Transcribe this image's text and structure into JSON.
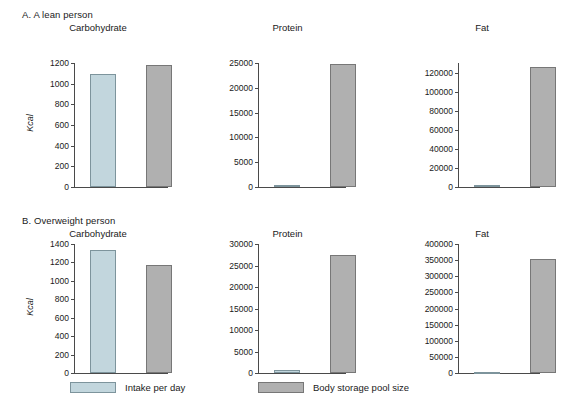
{
  "figure": {
    "panels": [
      {
        "id": "A",
        "label": "A. A lean person"
      },
      {
        "id": "B",
        "label": "B. Overweight person"
      }
    ],
    "axis_title": "Kcal",
    "legend": {
      "intake_label": "Intake per day",
      "storage_label": "Body storage pool size",
      "intake_color": "#c2d6dd",
      "storage_color": "#b0b0b0"
    }
  },
  "chart_data": [
    {
      "type": "bar",
      "panel": "A",
      "panel_label": "A. A lean person",
      "title": "Carbohydrate",
      "categories": [
        "Intake per day",
        "Body storage pool size"
      ],
      "values": [
        1090,
        1180
      ],
      "series": [
        {
          "name": "Intake per day",
          "values": [
            1090
          ]
        },
        {
          "name": "Body storage pool size",
          "values": [
            1180
          ]
        }
      ],
      "xlabel": "",
      "ylabel": "Kcal",
      "ylim": [
        0,
        1200
      ],
      "yticks": [
        0,
        200,
        400,
        600,
        800,
        1000,
        1200
      ],
      "ytick_labels": [
        "0",
        "200",
        "400",
        "600",
        "800",
        "1000",
        "1200"
      ],
      "grid": false,
      "legend_position": "bottom"
    },
    {
      "type": "bar",
      "panel": "A",
      "panel_label": "A. A lean person",
      "title": "Protein",
      "categories": [
        "Intake per day",
        "Body storage pool size"
      ],
      "values": [
        500,
        24700
      ],
      "series": [
        {
          "name": "Intake per day",
          "values": [
            500
          ]
        },
        {
          "name": "Body storage pool size",
          "values": [
            24700
          ]
        }
      ],
      "xlabel": "",
      "ylabel": "",
      "ylim": [
        0,
        25000
      ],
      "yticks": [
        0,
        5000,
        10000,
        15000,
        20000,
        25000
      ],
      "ytick_labels": [
        "0",
        "5000",
        "10000",
        "15000",
        "20000",
        "25000"
      ],
      "grid": false,
      "legend_position": "bottom"
    },
    {
      "type": "bar",
      "panel": "A",
      "panel_label": "A. A lean person",
      "title": "Fat",
      "categories": [
        "Intake per day",
        "Body storage pool size"
      ],
      "values": [
        2000,
        126000
      ],
      "series": [
        {
          "name": "Intake per day",
          "values": [
            2000
          ]
        },
        {
          "name": "Body storage pool size",
          "values": [
            126000
          ]
        }
      ],
      "xlabel": "",
      "ylabel": "",
      "ylim": [
        0,
        130000
      ],
      "yticks": [
        0,
        20000,
        40000,
        60000,
        80000,
        100000,
        120000
      ],
      "ytick_labels": [
        "0",
        "20000",
        "40000",
        "60000",
        "80000",
        "100000",
        "120000"
      ],
      "grid": false,
      "legend_position": "bottom"
    },
    {
      "type": "bar",
      "panel": "B",
      "panel_label": "B. Overweight person",
      "title": "Carbohydrate",
      "categories": [
        "Intake per day",
        "Body storage pool size"
      ],
      "values": [
        1330,
        1170
      ],
      "series": [
        {
          "name": "Intake per day",
          "values": [
            1330
          ]
        },
        {
          "name": "Body storage pool size",
          "values": [
            1170
          ]
        }
      ],
      "xlabel": "",
      "ylabel": "Kcal",
      "ylim": [
        0,
        1400
      ],
      "yticks": [
        0,
        200,
        400,
        600,
        800,
        1000,
        1200,
        1400
      ],
      "ytick_labels": [
        "0",
        "200",
        "400",
        "600",
        "800",
        "1000",
        "1200",
        "1400"
      ],
      "grid": false,
      "legend_position": "bottom"
    },
    {
      "type": "bar",
      "panel": "B",
      "panel_label": "B. Overweight person",
      "title": "Protein",
      "categories": [
        "Intake per day",
        "Body storage pool size"
      ],
      "values": [
        700,
        27500
      ],
      "series": [
        {
          "name": "Intake per day",
          "values": [
            700
          ]
        },
        {
          "name": "Body storage pool size",
          "values": [
            27500
          ]
        }
      ],
      "xlabel": "",
      "ylabel": "",
      "ylim": [
        0,
        30000
      ],
      "yticks": [
        0,
        5000,
        10000,
        15000,
        20000,
        25000,
        30000
      ],
      "ytick_labels": [
        "0",
        "5000",
        "10000",
        "15000",
        "20000",
        "25000",
        "30000"
      ],
      "grid": false,
      "legend_position": "bottom"
    },
    {
      "type": "bar",
      "panel": "B",
      "panel_label": "B. Overweight person",
      "title": "Fat",
      "categories": [
        "Intake per day",
        "Body storage pool size"
      ],
      "values": [
        2500,
        353000
      ],
      "series": [
        {
          "name": "Intake per day",
          "values": [
            2500
          ]
        },
        {
          "name": "Body storage pool size",
          "values": [
            353000
          ]
        }
      ],
      "xlabel": "",
      "ylabel": "",
      "ylim": [
        0,
        400000
      ],
      "yticks": [
        0,
        50000,
        100000,
        150000,
        200000,
        250000,
        300000,
        350000,
        400000
      ],
      "ytick_labels": [
        "0",
        "50000",
        "100000",
        "150000",
        "200000",
        "250000",
        "300000",
        "350000",
        "400000"
      ],
      "grid": false,
      "legend_position": "bottom"
    }
  ]
}
